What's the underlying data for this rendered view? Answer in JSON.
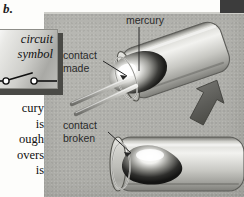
{
  "figure": {
    "label": "b.",
    "caption_fragments": [
      "cury",
      "is",
      "ough",
      "overs",
      "is"
    ]
  },
  "inset": {
    "name": "circuit-symbol-box",
    "line1": "circuit",
    "line2": "symbol",
    "symbol": "open-switch-symbol"
  },
  "panel": {
    "background_color": "#b4b4af",
    "labels": [
      {
        "key": "mercury",
        "text": "mercury"
      },
      {
        "key": "contact_made",
        "text": "contact\nmade",
        "line1": "contact",
        "line2": "made"
      },
      {
        "key": "contact_broken",
        "text": "contact\nbroken",
        "line1": "contact",
        "line2": "broken"
      }
    ],
    "illustrations": [
      {
        "key": "tilted-tube",
        "state": "contact made",
        "orientation": "tilted"
      },
      {
        "key": "horizontal-tube",
        "state": "contact broken",
        "orientation": "horizontal"
      }
    ],
    "arrow": {
      "key": "tilt-direction-arrow",
      "direction": "up-left",
      "color": "#5e5e59"
    }
  },
  "colors": {
    "page": "#fdfdfb",
    "panel": "#b4b4af",
    "ink": "#1d1d1d",
    "label": "#2a2a2a",
    "glass": "#c9c9c4",
    "mercury_highlight": "#ffffff",
    "mercury_dark": "#232323",
    "dark_edge": "#3c3c3c"
  }
}
